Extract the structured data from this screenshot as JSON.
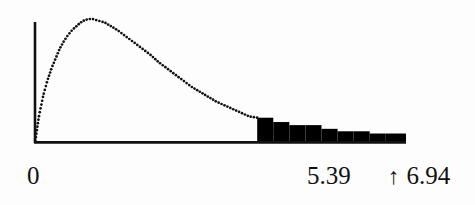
{
  "figure": {
    "name": "right-tail-density-plot",
    "background_color": "#fdfdfd",
    "ink_color": "#111111",
    "shade_color": "#000000"
  },
  "axis_labels": {
    "origin": "0",
    "cut_point": "5.39",
    "critical_marker": "↑",
    "critical_value": "6.94"
  },
  "chart_data": {
    "type": "area",
    "title": "",
    "xlabel": "",
    "ylabel": "",
    "grid": false,
    "legend": null,
    "xlim": [
      0,
      9.0
    ],
    "ylim": [
      0,
      1.0
    ],
    "tick_labels_x": [
      "0",
      "5.39",
      "6.94"
    ],
    "tick_values_x": [
      0,
      5.39,
      6.94
    ],
    "curve_style": "dotted",
    "annotations": [
      {
        "label": "5.39",
        "x": 5.39,
        "note": "left edge of shaded right tail"
      },
      {
        "label": "↑ 6.94",
        "x": 6.94,
        "note": "critical value marker below axis"
      }
    ],
    "shaded_region": {
      "from_x": 5.39,
      "to_x": 9.0,
      "fill": "#000000",
      "style": "stepped-histogram"
    },
    "x": [
      0.0,
      0.1,
      0.2,
      0.3,
      0.4,
      0.5,
      0.6,
      0.7,
      0.8,
      0.9,
      1.0,
      1.1,
      1.2,
      1.3,
      1.4,
      1.5,
      1.6,
      1.7,
      1.8,
      1.9,
      2.0,
      2.2,
      2.4,
      2.6,
      2.8,
      3.0,
      3.2,
      3.4,
      3.6,
      3.8,
      4.0,
      4.2,
      4.4,
      4.6,
      4.8,
      5.0,
      5.2,
      5.39,
      5.6,
      5.8,
      6.0,
      6.4,
      6.8,
      7.2,
      7.6,
      8.0,
      8.4,
      8.8,
      9.0
    ],
    "y": [
      0.0,
      0.22,
      0.38,
      0.5,
      0.6,
      0.68,
      0.76,
      0.82,
      0.87,
      0.91,
      0.94,
      0.97,
      0.99,
      1.0,
      1.0,
      0.99,
      0.98,
      0.97,
      0.95,
      0.93,
      0.91,
      0.86,
      0.81,
      0.76,
      0.71,
      0.65,
      0.6,
      0.55,
      0.5,
      0.45,
      0.41,
      0.37,
      0.33,
      0.3,
      0.27,
      0.24,
      0.21,
      0.2,
      0.18,
      0.16,
      0.15,
      0.12,
      0.1,
      0.08,
      0.07,
      0.06,
      0.05,
      0.04,
      0.04
    ],
    "tail_steps": [
      {
        "x0": 5.39,
        "x1": 5.78,
        "height": 0.2
      },
      {
        "x0": 5.78,
        "x1": 6.17,
        "height": 0.165
      },
      {
        "x0": 6.17,
        "x1": 6.56,
        "height": 0.14
      },
      {
        "x0": 6.56,
        "x1": 6.95,
        "height": 0.14
      },
      {
        "x0": 6.95,
        "x1": 7.34,
        "height": 0.11
      },
      {
        "x0": 7.34,
        "x1": 7.73,
        "height": 0.09
      },
      {
        "x0": 7.73,
        "x1": 8.12,
        "height": 0.09
      },
      {
        "x0": 8.12,
        "x1": 8.51,
        "height": 0.072
      },
      {
        "x0": 8.51,
        "x1": 9.0,
        "height": 0.072
      }
    ]
  }
}
